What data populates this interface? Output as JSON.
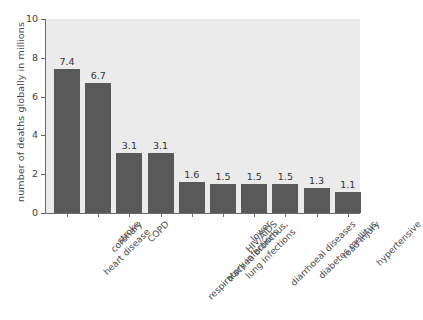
{
  "chart_data": {
    "type": "bar",
    "title": "",
    "xlabel": "",
    "ylabel": "number of deaths globally in millions",
    "ylim": [
      0,
      10
    ],
    "ytick_values": [
      0,
      2,
      4,
      6,
      8,
      10
    ],
    "ytick_labels": [
      "0",
      "2",
      "4",
      "6",
      "8",
      "10"
    ],
    "grid": false,
    "legend": false,
    "bar_color": "#595959",
    "plot_background": "#ebebeb",
    "figure_background": "#ffffff",
    "axis_color": "#6b6b6b",
    "categories": [
      "coronary heart disease",
      "stroke",
      "COPD",
      "lower respiratory infections",
      "trachea bronchus, lung infections",
      "HIV/AIDS",
      "diarrhoeal diseases",
      "diabetes mellitus",
      "road injury",
      "hypertensive"
    ],
    "category_lines": [
      [
        "coronary",
        "heart disease"
      ],
      [
        "stroke"
      ],
      [
        "COPD"
      ],
      [
        "lower",
        "respiratory infections"
      ],
      [
        "trachea bronchus,",
        "lung infections"
      ],
      [
        "HIV/AIDS"
      ],
      [
        "diarrhoeal diseases"
      ],
      [
        "diabetes mellitus"
      ],
      [
        "road injury"
      ],
      [
        "hypertensive"
      ]
    ],
    "values": [
      7.4,
      6.7,
      3.1,
      3.1,
      1.6,
      1.5,
      1.5,
      1.5,
      1.3,
      1.1
    ],
    "value_labels": [
      "7.4",
      "6.7",
      "3.1",
      "3.1",
      "1.6",
      "1.5",
      "1.5",
      "1.5",
      "1.3",
      "1.1"
    ]
  }
}
